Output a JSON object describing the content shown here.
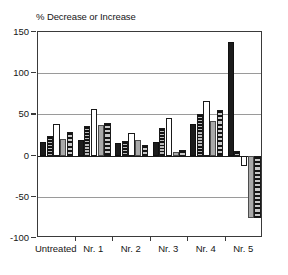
{
  "chart_data": {
    "type": "bar",
    "title": "% Decrease or Increase",
    "xlabel": "",
    "ylabel": "% Decrease or Increase",
    "ylim": [
      -100,
      150
    ],
    "yticks": [
      150,
      100,
      50,
      0,
      -50,
      -100
    ],
    "ytick_labels": [
      "150",
      "100",
      "50",
      "0",
      "-50",
      "-100"
    ],
    "grid": true,
    "legend": "none",
    "categories": [
      "Untreated",
      "Nr. 1",
      "Nr. 2",
      "Nr. 3",
      "Nr. 4",
      "Nr. 5"
    ],
    "series": [
      {
        "name": "Series 1",
        "style": "black",
        "values": [
          17,
          19,
          15,
          16,
          38,
          138
        ]
      },
      {
        "name": "Series 2",
        "style": "darkstripe",
        "values": [
          24,
          36,
          18,
          34,
          50,
          5
        ]
      },
      {
        "name": "Series 3",
        "style": "white",
        "values": [
          38,
          57,
          28,
          46,
          66,
          -13
        ]
      },
      {
        "name": "Series 4",
        "style": "gray",
        "values": [
          20,
          37,
          19,
          4,
          42,
          -76
        ]
      },
      {
        "name": "Series 5",
        "style": "graystripe",
        "values": [
          29,
          40,
          13,
          7,
          55,
          -76
        ]
      }
    ]
  },
  "axis": {
    "y_tick_labels": [
      "150",
      "100",
      "50",
      "0",
      "-50",
      "-100"
    ],
    "x_tick_labels": [
      "Untreated",
      "Nr. 1",
      "Nr. 2",
      "Nr. 3",
      "Nr. 4",
      "Nr. 5"
    ]
  },
  "colors": {
    "series_black": "#1c1c1c",
    "series_white": "#ffffff",
    "series_gray": "#a9a9a9",
    "grid": "#9a9a9a",
    "axis": "#3a3a3a",
    "text": "#161616"
  }
}
